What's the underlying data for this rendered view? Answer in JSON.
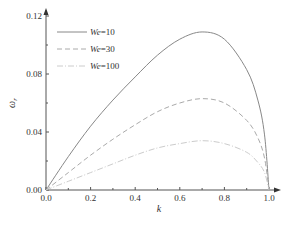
{
  "chart_data": {
    "type": "line",
    "title": "",
    "xlabel": "k",
    "ylabel": "ωr",
    "xlim": [
      0.0,
      1.0
    ],
    "ylim": [
      0.0,
      0.12
    ],
    "grid": false,
    "legend_position": "upper left",
    "x_ticks": [
      "0.0",
      "0.2",
      "0.4",
      "0.6",
      "0.8",
      "1.0"
    ],
    "y_ticks": [
      "0.00",
      "0.04",
      "0.08",
      "0.12"
    ],
    "x": [
      0.0,
      0.1,
      0.2,
      0.3,
      0.4,
      0.5,
      0.6,
      0.7,
      0.8,
      0.9,
      0.95,
      0.98,
      1.0
    ],
    "series": [
      {
        "name": "We=10",
        "style": "solid",
        "color": "#888888",
        "values": [
          0.0,
          0.023,
          0.044,
          0.062,
          0.078,
          0.093,
          0.104,
          0.109,
          0.104,
          0.083,
          0.062,
          0.038,
          0.0
        ]
      },
      {
        "name": "We=30",
        "style": "dashed",
        "color": "#aaaaaa",
        "values": [
          0.0,
          0.012,
          0.024,
          0.035,
          0.045,
          0.054,
          0.06,
          0.063,
          0.06,
          0.048,
          0.036,
          0.022,
          0.0
        ]
      },
      {
        "name": "We=100",
        "style": "dash-dot",
        "color": "#cccccc",
        "values": [
          0.0,
          0.006,
          0.012,
          0.018,
          0.024,
          0.029,
          0.032,
          0.034,
          0.032,
          0.026,
          0.019,
          0.012,
          0.0
        ]
      }
    ]
  },
  "legend": {
    "items": [
      {
        "prefix": "We",
        "suffix": "=10"
      },
      {
        "prefix": "We",
        "suffix": "=30"
      },
      {
        "prefix": "We",
        "suffix": "=100"
      }
    ]
  },
  "axes": {
    "x_label": "k",
    "y_label_main": "ω",
    "y_label_sub": "r"
  }
}
